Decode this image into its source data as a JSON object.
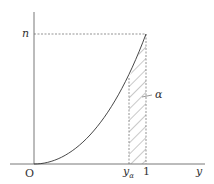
{
  "diagram": {
    "type": "distribution curve with shaded tail area",
    "labels": {
      "origin": "O",
      "y_axis_top": "n",
      "x_axis": "y",
      "critical_value": "y",
      "critical_value_sub": "α",
      "x_one": "1",
      "area": "α"
    },
    "colors": {
      "axis": "#555555",
      "curve": "#333333",
      "dashed": "#666666",
      "hatch": "#777777",
      "text": "#333333"
    }
  }
}
